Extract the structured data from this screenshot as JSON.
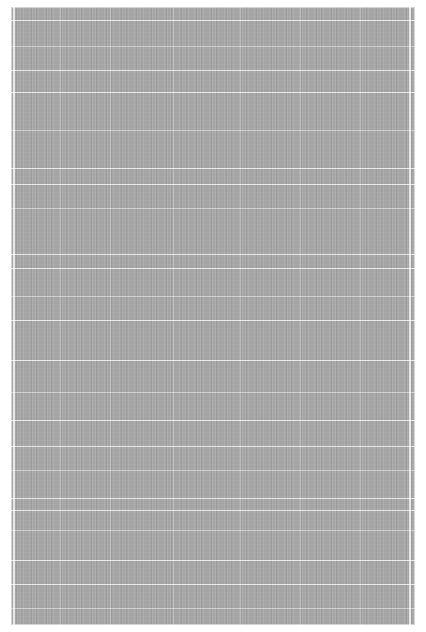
{
  "image": {
    "subject": "gray woven rug texture with white stripes",
    "colors": {
      "base": "#a4a4a4",
      "stripe": "#ffffff",
      "background": "#ffffff"
    },
    "horizontal_stripes_y": [
      20,
      46,
      70,
      92,
      130,
      168,
      184,
      208,
      254,
      268,
      296,
      320,
      360,
      392,
      420,
      446,
      470,
      498,
      510,
      530,
      560,
      584,
      608
    ],
    "vertical_lines_x": [
      60,
      110,
      173,
      240,
      300,
      360
    ]
  }
}
